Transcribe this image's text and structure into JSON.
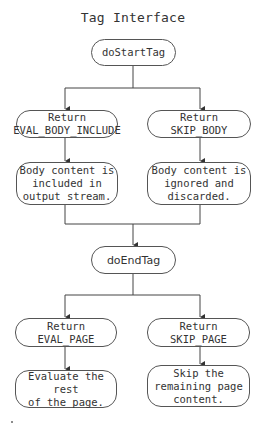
{
  "diagram": {
    "title": "Tag Interface",
    "nodes": {
      "do_start_tag": "doStartTag",
      "return_eval_body_include": "Return\nEVAL_BODY_INCLUDE",
      "return_skip_body": "Return\nSKIP_BODY",
      "body_included": "Body content is\nincluded in\noutput stream.",
      "body_ignored": "Body content is\nignored and\ndiscarded.",
      "do_end_tag": "doEndTag",
      "return_eval_page": "Return EVAL_PAGE",
      "return_skip_page": "Return SKIP_PAGE",
      "evaluate_rest": "Evaluate the rest\nof the page.",
      "skip_remaining": "Skip the\nremaining page\ncontent."
    },
    "edges": [
      {
        "from": "doStartTag",
        "to": "Return EVAL_BODY_INCLUDE"
      },
      {
        "from": "doStartTag",
        "to": "Return SKIP_BODY"
      },
      {
        "from": "Return EVAL_BODY_INCLUDE",
        "to": "Body content is included in output stream."
      },
      {
        "from": "Return SKIP_BODY",
        "to": "Body content is ignored and discarded."
      },
      {
        "from": "Body content is included in output stream.",
        "to": "doEndTag"
      },
      {
        "from": "Body content is ignored and discarded.",
        "to": "doEndTag"
      },
      {
        "from": "doEndTag",
        "to": "Return EVAL_PAGE"
      },
      {
        "from": "doEndTag",
        "to": "Return SKIP_PAGE"
      },
      {
        "from": "Return EVAL_PAGE",
        "to": "Evaluate the rest of the page."
      },
      {
        "from": "Return SKIP_PAGE",
        "to": "Skip the remaining page content."
      }
    ],
    "colors": {
      "line": "#444444",
      "border": "#555555",
      "text": "#333333",
      "background": "#ffffff"
    }
  }
}
